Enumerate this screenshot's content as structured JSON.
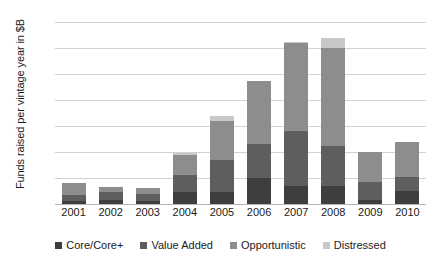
{
  "chart_data": {
    "type": "bar",
    "subtype": "stacked-bar",
    "title": "",
    "xlabel": "",
    "ylabel": "Funds raised per vintage year in $B",
    "ylim": [
      0,
      140
    ],
    "yticks": [
      0,
      20,
      40,
      60,
      80,
      100,
      120,
      140
    ],
    "grid": true,
    "legend_position": "bottom",
    "categories": [
      "2001",
      "2002",
      "2003",
      "2004",
      "2005",
      "2006",
      "2007",
      "2008",
      "2009",
      "2010"
    ],
    "series": [
      {
        "name": "Core/Core+",
        "color": "#3e3e3e",
        "values": [
          2,
          3,
          2,
          9,
          9,
          20,
          14,
          14,
          3,
          10
        ]
      },
      {
        "name": "Value Added",
        "color": "#5e5e5e",
        "values": [
          5,
          6,
          6,
          13,
          25,
          26,
          42,
          31,
          14,
          11
        ]
      },
      {
        "name": "Opportunistic",
        "color": "#8d8d8d",
        "values": [
          9,
          4,
          4,
          16,
          30,
          49,
          68,
          75,
          23,
          27
        ]
      },
      {
        "name": "Distressed",
        "color": "#c8c8c8",
        "values": [
          0,
          0,
          0,
          1,
          4,
          0,
          1,
          8,
          0,
          0
        ]
      }
    ],
    "totals": [
      16,
      13,
      12,
      39,
      68,
      95,
      125,
      128,
      40,
      48
    ]
  },
  "axis": {
    "ytick_labels": [
      "0",
      "20",
      "40",
      "60",
      "80",
      "100",
      "120",
      "140"
    ],
    "ylabel_text": "Funds raised per vintage year in $B"
  },
  "legend": {
    "items": [
      {
        "label": "Core/Core+",
        "color": "#3e3e3e"
      },
      {
        "label": "Value Added",
        "color": "#5e5e5e"
      },
      {
        "label": "Opportunistic",
        "color": "#8d8d8d"
      },
      {
        "label": "Distressed",
        "color": "#c8c8c8"
      }
    ]
  },
  "colors": {
    "background": "#ffffff",
    "gridline": "#d2d2d2",
    "axis": "#b4b4b4",
    "text": "#1b1b1b"
  }
}
